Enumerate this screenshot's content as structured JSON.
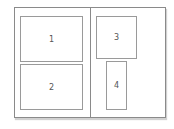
{
  "diagram": {
    "panels": [
      {
        "id": "left-panel"
      },
      {
        "id": "right-panel"
      }
    ],
    "boxes": [
      {
        "label": "1",
        "panel": "left"
      },
      {
        "label": "2",
        "panel": "left"
      },
      {
        "label": "3",
        "panel": "right"
      },
      {
        "label": "4",
        "panel": "right"
      }
    ],
    "colors": {
      "border": "#8a8a8a",
      "box_border": "#9a9a9a",
      "label": "#555555",
      "background": "#ffffff"
    }
  }
}
